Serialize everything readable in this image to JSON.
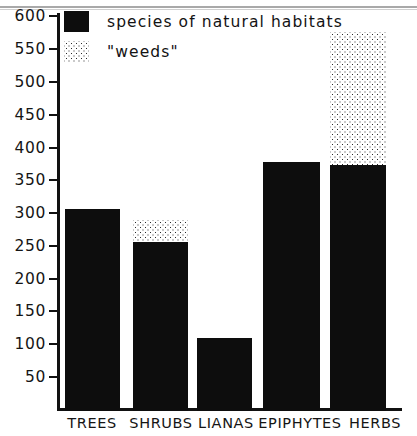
{
  "chart_data": {
    "type": "bar",
    "title": "",
    "xlabel": "",
    "ylabel": "",
    "stacked": true,
    "grid": false,
    "ylim": [
      0,
      600
    ],
    "yticks": [
      50,
      100,
      150,
      200,
      250,
      300,
      350,
      400,
      450,
      500,
      550,
      600
    ],
    "categories": [
      "TREES",
      "SHRUBS",
      "LIANAS",
      "EPIPHYTES",
      "HERBS"
    ],
    "series": [
      {
        "name": "species of natural habitats",
        "fill": "solid-black",
        "color": "#0d0d0d",
        "values": [
          308,
          257,
          111,
          379,
          375
        ]
      },
      {
        "name": "\"weeds\"",
        "fill": "dotted-stipple",
        "color": "#2a2a2a",
        "values": [
          0,
          34,
          0,
          0,
          202
        ]
      }
    ],
    "totals": [
      308,
      291,
      111,
      379,
      577
    ],
    "legend_position": "top-left",
    "axis_color": "#111111"
  },
  "legend": {
    "items": [
      {
        "label": "species of natural habitats",
        "swatch": "solid-black-swatch"
      },
      {
        "label": "\"weeds\"",
        "swatch": "dotted-stipple-swatch"
      }
    ]
  },
  "yaxis": {
    "labels": [
      "600",
      "550",
      "500",
      "450",
      "400",
      "350",
      "300",
      "250",
      "200",
      "150",
      "100",
      "50"
    ]
  },
  "xaxis": {
    "labels": [
      "TREES",
      "SHRUBS",
      "LIANAS",
      "EPIPHYTES",
      "HERBS"
    ]
  }
}
